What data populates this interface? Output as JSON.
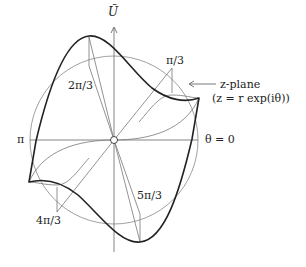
{
  "diagram": {
    "axis_label": "Ũ",
    "angle_labels": {
      "zero": "θ = 0",
      "pi_over_3": "π/3",
      "two_pi_over_3": "2π/3",
      "pi": "π",
      "four_pi_over_3": "4π/3",
      "five_pi_over_3": "5π/3"
    },
    "annotation": {
      "line1": "z-plane",
      "line2": "(z = r exp(iθ))"
    },
    "colors": {
      "thick_curve": "#222222",
      "thin_lines": "#777777",
      "circle": "#888888"
    }
  }
}
